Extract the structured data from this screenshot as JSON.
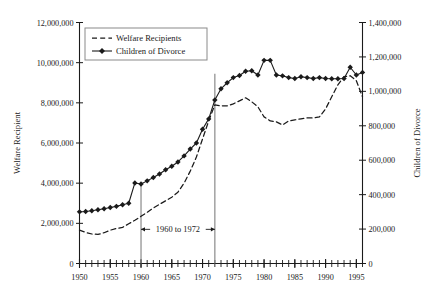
{
  "chart_data": {
    "type": "line",
    "title": "",
    "xlabel": "",
    "ylabel": "Welfare Recipient",
    "y2label": "Children of Divorce",
    "xlim": [
      1950,
      1996
    ],
    "ylim": [
      0,
      12000000
    ],
    "y2lim": [
      0,
      1400000
    ],
    "grid": false,
    "legend_position": "top-left-inside",
    "x_tick_labels": [
      "1950",
      "1955",
      "1960",
      "1965",
      "1970",
      "1975",
      "1980",
      "1985",
      "1990",
      "1995"
    ],
    "x_tick_values": [
      1950,
      1955,
      1960,
      1965,
      1970,
      1975,
      1980,
      1985,
      1990,
      1995
    ],
    "x_minor_tick_step": 1,
    "y_tick_labels": [
      "0",
      "2,000,000",
      "4,000,000",
      "6,000,000",
      "8,000,000",
      "10,000,000",
      "12,000,000"
    ],
    "y_tick_values": [
      0,
      2000000,
      4000000,
      6000000,
      8000000,
      10000000,
      12000000
    ],
    "y2_tick_labels": [
      "0",
      "200,000",
      "400,000",
      "600,000",
      "800,000",
      "1,000,000",
      "1,200,000",
      "1,400,000"
    ],
    "y2_tick_values": [
      0,
      200000,
      400000,
      600000,
      800000,
      1000000,
      1200000,
      1400000
    ],
    "annotations": [
      {
        "name": "range-marker",
        "text": "1960 to 1972",
        "from_year": 1960,
        "to_year": 1972
      }
    ],
    "vertical_markers": [
      {
        "year": 1960,
        "top_value": 4050000
      },
      {
        "year": 1972,
        "top_value": 9450000
      }
    ],
    "series": [
      {
        "name": "Welfare Recipients",
        "axis": "left",
        "style": "dashed",
        "marker": "none",
        "color": "#1a1a1a",
        "x": [
          1950,
          1951,
          1952,
          1953,
          1954,
          1955,
          1956,
          1957,
          1958,
          1959,
          1960,
          1961,
          1962,
          1963,
          1964,
          1965,
          1966,
          1967,
          1968,
          1969,
          1970,
          1971,
          1972,
          1973,
          1974,
          1975,
          1976,
          1977,
          1978,
          1979,
          1980,
          1981,
          1982,
          1983,
          1984,
          1985,
          1986,
          1987,
          1988,
          1989,
          1990,
          1991,
          1992,
          1993,
          1994,
          1995,
          1996
        ],
        "values": [
          1660000,
          1550000,
          1470000,
          1450000,
          1530000,
          1660000,
          1740000,
          1800000,
          1980000,
          2150000,
          2350000,
          2550000,
          2760000,
          2950000,
          3120000,
          3300000,
          3550000,
          4000000,
          4600000,
          5300000,
          6200000,
          7100000,
          7900000,
          7850000,
          7850000,
          7950000,
          8100000,
          8250000,
          8050000,
          7800000,
          7300000,
          7100000,
          7050000,
          6900000,
          7100000,
          7150000,
          7200000,
          7250000,
          7250000,
          7300000,
          7700000,
          8300000,
          8900000,
          9300000,
          9350000,
          9100000,
          8300000
        ]
      },
      {
        "name": "Children of Divorce",
        "axis": "right",
        "style": "solid",
        "marker": "diamond",
        "color": "#1a1a1a",
        "x": [
          1950,
          1951,
          1952,
          1953,
          1954,
          1955,
          1956,
          1957,
          1958,
          1959,
          1960,
          1961,
          1962,
          1963,
          1964,
          1965,
          1966,
          1967,
          1968,
          1969,
          1970,
          1971,
          1972,
          1973,
          1974,
          1975,
          1976,
          1977,
          1978,
          1979,
          1980,
          1981,
          1982,
          1983,
          1984,
          1985,
          1986,
          1987,
          1988,
          1989,
          1990,
          1991,
          1992,
          1993,
          1994,
          1995,
          1996
        ],
        "values": [
          300000,
          302000,
          306000,
          312000,
          318000,
          325000,
          332000,
          341000,
          350000,
          468000,
          462000,
          480000,
          500000,
          520000,
          545000,
          565000,
          590000,
          625000,
          665000,
          700000,
          780000,
          840000,
          950000,
          1015000,
          1050000,
          1080000,
          1092000,
          1117000,
          1120000,
          1095000,
          1180000,
          1180000,
          1095000,
          1090000,
          1080000,
          1075000,
          1085000,
          1080000,
          1075000,
          1080000,
          1075000,
          1073000,
          1073000,
          1075000,
          1140000,
          1095000,
          1110000
        ]
      }
    ]
  },
  "legend": {
    "items": [
      {
        "label": "Welfare Recipients",
        "style": "dashed"
      },
      {
        "label": "Children of Divorce",
        "style": "diamond"
      }
    ]
  },
  "axis_titles": {
    "left": "Welfare Recipient",
    "right": "Children of Divorce"
  }
}
